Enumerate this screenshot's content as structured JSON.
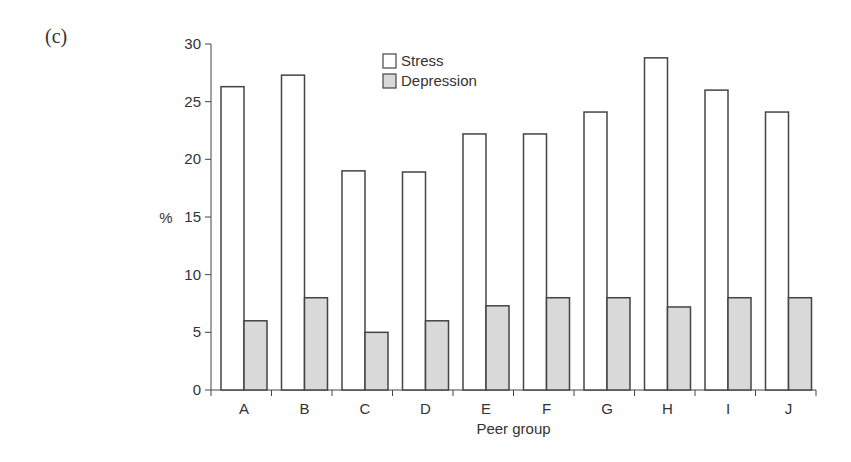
{
  "panel_label": "(c)",
  "chart_data": {
    "type": "bar",
    "title": "",
    "xlabel": "Peer group",
    "ylabel": "%",
    "ylim": [
      0,
      30
    ],
    "yticks": [
      0,
      5,
      10,
      15,
      20,
      25,
      30
    ],
    "grid": false,
    "legend_position": "top-center",
    "categories": [
      "A",
      "B",
      "C",
      "D",
      "E",
      "F",
      "G",
      "H",
      "I",
      "J"
    ],
    "series": [
      {
        "name": "Stress",
        "color": "#ffffff",
        "values": [
          26.3,
          27.3,
          19.0,
          18.9,
          22.2,
          22.2,
          24.1,
          28.8,
          26.0,
          24.1
        ]
      },
      {
        "name": "Depression",
        "color": "#d9d9d9",
        "values": [
          6.0,
          8.0,
          5.0,
          6.0,
          7.3,
          8.0,
          8.0,
          7.2,
          8.0,
          8.0
        ]
      }
    ]
  },
  "legend": {
    "items": [
      {
        "label": "Stress",
        "color": "#ffffff"
      },
      {
        "label": "Depression",
        "color": "#d9d9d9"
      }
    ]
  }
}
